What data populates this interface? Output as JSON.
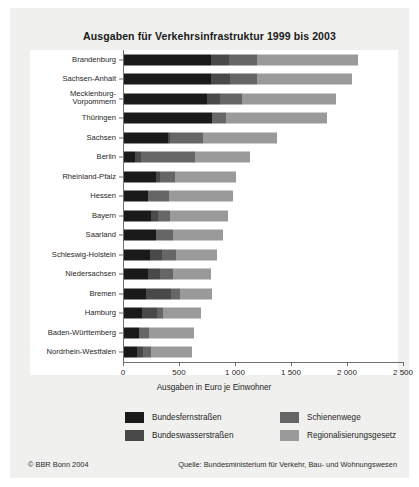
{
  "chart_data": {
    "type": "bar",
    "orientation": "horizontal",
    "stacked": true,
    "title": "Ausgaben für Verkehrsinfrastruktur 1999 bis 2003",
    "xlabel": "Ausgaben in Euro je Einwohner",
    "ylabel": "",
    "xlim": [
      0,
      2500
    ],
    "xticks": [
      0,
      500,
      1000,
      1500,
      2000,
      2500
    ],
    "xtick_labels": [
      "0",
      "500",
      "1 000",
      "1 500",
      "2 000",
      "2 500"
    ],
    "grid": false,
    "legend_position": "bottom",
    "categories": [
      "Brandenburg",
      "Sachsen-Anhalt",
      "Mecklenburg-\nVorpommern",
      "Thüringen",
      "Sachsen",
      "Berlin",
      "Rheinland-Pfalz",
      "Hessen",
      "Bayern",
      "Saarland",
      "Schleswig-Holstein",
      "Niedersachsen",
      "Bremen",
      "Hamburg",
      "Baden-Württemberg",
      "Nordrhein-Westfalen"
    ],
    "series": [
      {
        "name": "Bundesfernstraßen",
        "color": "#1a1a1a",
        "values": [
          780,
          775,
          745,
          790,
          390,
          95,
          285,
          215,
          245,
          290,
          235,
          215,
          200,
          160,
          135,
          115
        ]
      },
      {
        "name": "Bundeswasserstraßen",
        "color": "#494949",
        "values": [
          155,
          175,
          110,
          0,
          25,
          60,
          40,
          0,
          60,
          0,
          105,
          110,
          220,
          135,
          0,
          55
        ]
      },
      {
        "name": "Schienenwege",
        "color": "#666666",
        "values": [
          250,
          235,
          200,
          120,
          290,
          480,
          130,
          185,
          105,
          145,
          120,
          110,
          80,
          55,
          90,
          70
        ]
      },
      {
        "name": "Regionalisierungsgesetz",
        "color": "#9a9a9a",
        "values": [
          900,
          855,
          840,
          900,
          665,
          490,
          545,
          570,
          515,
          450,
          370,
          345,
          290,
          340,
          400,
          365
        ]
      }
    ],
    "totals": [
      2085,
      2040,
      1895,
      1810,
      1370,
      1125,
      1000,
      970,
      925,
      885,
      830,
      780,
      790,
      690,
      625,
      605
    ]
  },
  "legend": {
    "items": [
      {
        "label": "Bundesfernstraßen",
        "color": "#1a1a1a"
      },
      {
        "label": "Bundeswasserstraßen",
        "color": "#494949"
      },
      {
        "label": "Schienenwege",
        "color": "#666666"
      },
      {
        "label": "Regionalisierungsgesetz",
        "color": "#9a9a9a"
      }
    ]
  },
  "footer": {
    "left": "© BBR Bonn 2004",
    "right": "Quelle: Bundesministerium für Verkehr, Bau- und Wohnungswesen"
  }
}
